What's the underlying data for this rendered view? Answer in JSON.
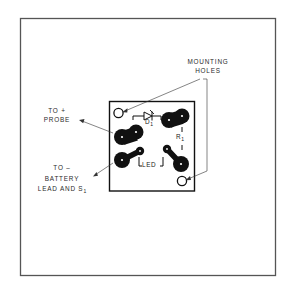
{
  "figure": {
    "type": "pcb-component-layout",
    "colors": {
      "background": "#ffffff",
      "frame": "#555555",
      "ink": "#111111",
      "text": "#2a2a2a"
    }
  },
  "labels": {
    "mounting_holes": [
      "MOUNTING",
      "HOLES"
    ],
    "to_plus_probe": [
      "TO +",
      "PROBE"
    ],
    "to_minus_battery": [
      "TO –",
      "BATTERY",
      "LEAD AND S"
    ],
    "to_minus_battery_subscript": "1"
  },
  "components": {
    "diode": {
      "letter": "D",
      "subscript": "1"
    },
    "resistor": {
      "letter": "R",
      "subscript": "1"
    },
    "led": {
      "label": "LED"
    }
  }
}
